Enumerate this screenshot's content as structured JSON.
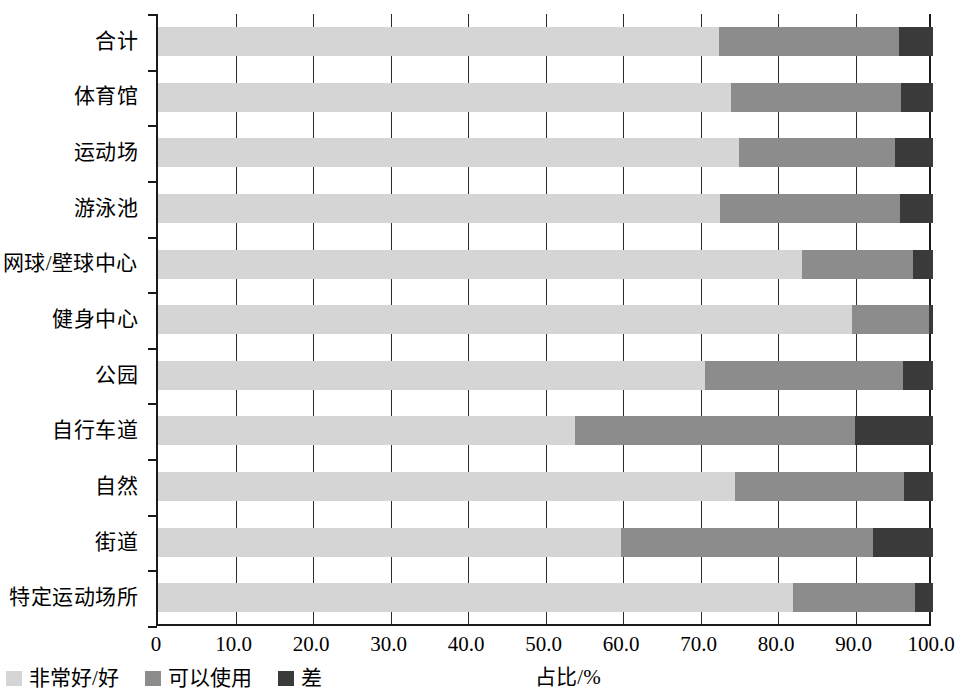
{
  "chart_data": {
    "type": "bar",
    "orientation": "horizontal",
    "stacked": true,
    "stacked_mode": "percent",
    "title": "",
    "xlabel": "占比/%",
    "ylabel": "",
    "xlim": [
      0,
      100
    ],
    "xticks": [
      "0",
      "10.0",
      "20.0",
      "30.0",
      "40.0",
      "50.0",
      "60.0",
      "70.0",
      "80.0",
      "90.0",
      "100.0"
    ],
    "xtick_values": [
      0,
      10,
      20,
      30,
      40,
      50,
      60,
      70,
      80,
      90,
      100
    ],
    "grid": "vertical",
    "legend_position": "bottom-left",
    "categories": [
      "合计",
      "体育馆",
      "运动场",
      "游泳池",
      "网球/壁球中心",
      "健身中心",
      "公园",
      "自行车道",
      "自然",
      "街道",
      "特定运动场所"
    ],
    "series": [
      {
        "name": "非常好/好",
        "color": "#d5d5d5",
        "values": [
          72.4,
          73.9,
          75.0,
          72.5,
          83.1,
          89.5,
          70.6,
          53.8,
          74.5,
          59.7,
          81.9
        ]
      },
      {
        "name": "可以使用",
        "color": "#8c8c8c",
        "values": [
          23.2,
          22.0,
          20.1,
          23.2,
          14.3,
          10.0,
          25.5,
          36.1,
          21.8,
          32.6,
          15.8
        ]
      },
      {
        "name": "差",
        "color": "#3a3a3a",
        "values": [
          4.4,
          4.1,
          4.9,
          4.3,
          2.6,
          0.5,
          3.9,
          10.1,
          3.7,
          7.7,
          2.3
        ]
      }
    ]
  },
  "legend": {
    "items": [
      {
        "label": "非常好/好",
        "color": "#d5d5d5"
      },
      {
        "label": "可以使用",
        "color": "#8c8c8c"
      },
      {
        "label": "差",
        "color": "#3a3a3a"
      }
    ]
  }
}
